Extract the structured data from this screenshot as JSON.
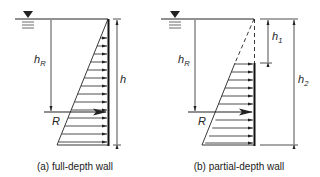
{
  "panels": [
    {
      "id": "a",
      "caption": "(a) full-depth wall",
      "labels": {
        "hR_main": "h",
        "hR_sub": "R",
        "h": "h",
        "R": "R"
      }
    },
    {
      "id": "b",
      "caption": "(b) partial-depth wall",
      "labels": {
        "hR_main": "h",
        "hR_sub": "R",
        "h1_main": "h",
        "h1_sub": "1",
        "h2_main": "h",
        "h2_sub": "2",
        "R": "R"
      }
    }
  ],
  "colors": {
    "line": "#222222",
    "background": "#ffffff"
  }
}
